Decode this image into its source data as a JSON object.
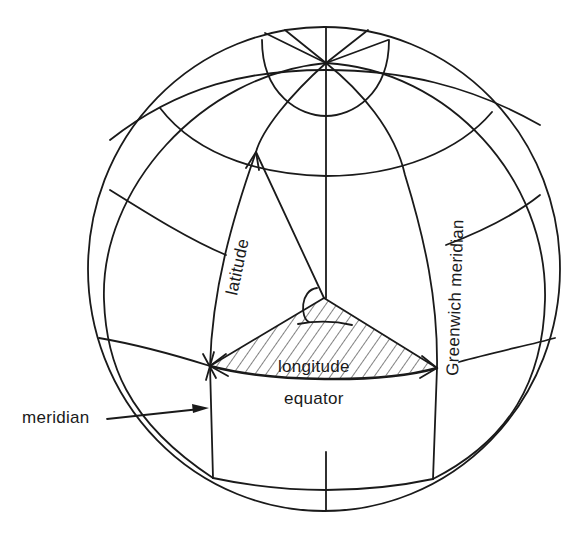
{
  "figure": {
    "labels": {
      "latitude": "latitude",
      "longitude": "longitude",
      "equator": "equator",
      "greenwich": "Greenwich meridian",
      "meridian": "meridian"
    },
    "colors": {
      "line": "#1a1a1a",
      "background": "#ffffff"
    }
  }
}
